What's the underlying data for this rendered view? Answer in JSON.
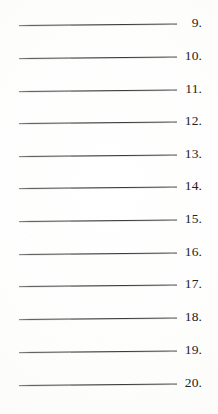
{
  "document": {
    "type": "worksheet-answer-lines",
    "description": "Scanned blank numbered answer lines",
    "background_color": "#fefefe",
    "line_color": "#3c3c3c",
    "number_color": "#232323",
    "first_number": 9,
    "last_number": 20,
    "row_count": 12
  },
  "rows": [
    {
      "number": "9.",
      "line_value": "",
      "top": 6
    },
    {
      "number": "10.",
      "line_value": "",
      "top": 39
    },
    {
      "number": "11.",
      "line_value": "",
      "top": 72
    },
    {
      "number": "12.",
      "line_value": "",
      "top": 104
    },
    {
      "number": "13.",
      "line_value": "",
      "top": 137
    },
    {
      "number": "14.",
      "line_value": "",
      "top": 169
    },
    {
      "number": "15.",
      "line_value": "",
      "top": 202
    },
    {
      "number": "16.",
      "line_value": "",
      "top": 235
    },
    {
      "number": "17.",
      "line_value": "",
      "top": 267
    },
    {
      "number": "18.",
      "line_value": "",
      "top": 300
    },
    {
      "number": "19.",
      "line_value": "",
      "top": 333
    },
    {
      "number": "20.",
      "line_value": "",
      "top": 366
    }
  ]
}
